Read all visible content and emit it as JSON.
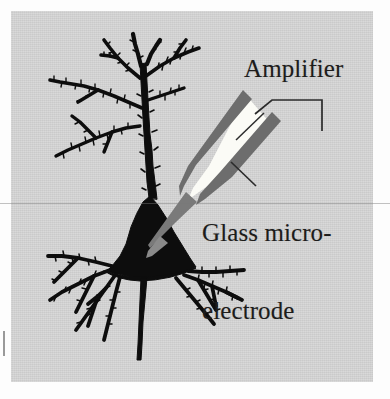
{
  "figure": {
    "kind": "scientific-illustration",
    "background_color": "#d6d6d6",
    "page_color": "#fdfdfd",
    "ink_color": "#101010",
    "pipette_wall_color": "#6f6f6f",
    "pipette_lumen_color": "#fbfbf7",
    "leader_color": "#2a2a2a"
  },
  "labels": {
    "amplifier": "Amplifier",
    "electrode_line1": "Glass micro-",
    "electrode_line2": "electrode"
  },
  "parts": {
    "neuron": "neuron-silhouette",
    "soma": "soma",
    "apical_dendrite": "apical-dendrite",
    "basal_dendrites": "basal-dendrites",
    "axon": "axon",
    "pipette": "glass-microelectrode",
    "amplifier_leader": "amplifier-leader-line",
    "electrode_leader": "electrode-leader-line",
    "scanline": "scan-artifact-line",
    "margin_tick": "margin-tick-mark"
  }
}
